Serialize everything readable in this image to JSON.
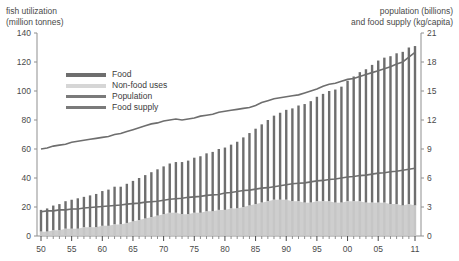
{
  "chart_data": {
    "type": "bar",
    "title": "",
    "subtitle": "",
    "ylabel": "fish utilization\n(million tonnes)",
    "ylabel_right": "population (billions)\nand food supply (kg/capita)",
    "xlabel": "",
    "ylim": [
      0,
      140
    ],
    "ylim_right": [
      0,
      21
    ],
    "yticks": [
      0,
      20,
      40,
      60,
      80,
      100,
      120,
      140
    ],
    "yticks_right": [
      0,
      3,
      6,
      9,
      12,
      15,
      18,
      21
    ],
    "grid": false,
    "legend_position": "upper-left",
    "x": [
      1950,
      1951,
      1952,
      1953,
      1954,
      1955,
      1956,
      1957,
      1958,
      1959,
      1960,
      1961,
      1962,
      1963,
      1964,
      1965,
      1966,
      1967,
      1968,
      1969,
      1970,
      1971,
      1972,
      1973,
      1974,
      1975,
      1976,
      1977,
      1978,
      1979,
      1980,
      1981,
      1982,
      1983,
      1984,
      1985,
      1986,
      1987,
      1988,
      1989,
      1990,
      1991,
      1992,
      1993,
      1994,
      1995,
      1996,
      1997,
      1998,
      1999,
      2000,
      2001,
      2002,
      2003,
      2004,
      2005,
      2006,
      2007,
      2008,
      2009,
      2010,
      2011
    ],
    "xticks": [
      1950,
      1955,
      1960,
      1965,
      1970,
      1975,
      1980,
      1985,
      1990,
      1995,
      2000,
      2005,
      2011
    ],
    "xticklabels": [
      "50",
      "55",
      "60",
      "65",
      "70",
      "75",
      "80",
      "85",
      "90",
      "95",
      "00",
      "05",
      "11"
    ],
    "series": [
      {
        "name": "Food",
        "type": "bar-segment",
        "color": "#6e6e6e",
        "values": [
          15,
          16,
          17,
          18,
          19,
          20,
          21,
          21,
          22,
          23,
          24,
          25,
          26,
          26,
          27,
          28,
          29,
          30,
          31,
          32,
          33,
          34,
          35,
          36,
          37,
          38,
          39,
          40,
          41,
          42,
          43,
          44,
          46,
          48,
          50,
          52,
          54,
          56,
          58,
          60,
          62,
          64,
          66,
          68,
          70,
          72,
          74,
          76,
          78,
          80,
          83,
          86,
          89,
          92,
          95,
          98,
          100,
          102,
          104,
          106,
          108,
          110
        ]
      },
      {
        "name": "Non-food uses",
        "type": "bar-segment",
        "color": "#c6c6c6",
        "values": [
          3,
          3,
          4,
          4,
          5,
          5,
          5,
          6,
          6,
          6,
          7,
          7,
          8,
          8,
          9,
          10,
          11,
          12,
          13,
          14,
          15,
          16,
          16,
          15,
          15,
          16,
          16,
          17,
          17,
          18,
          18,
          19,
          19,
          20,
          21,
          22,
          23,
          24,
          25,
          25,
          25,
          24,
          24,
          23,
          23,
          24,
          24,
          24,
          23,
          23,
          24,
          24,
          24,
          23,
          23,
          23,
          23,
          22,
          22,
          21,
          22,
          21
        ]
      },
      {
        "name": "Population",
        "type": "line",
        "axis": "right",
        "color": "#6e6e6e",
        "values": [
          2.5,
          2.6,
          2.6,
          2.7,
          2.7,
          2.8,
          2.8,
          2.9,
          2.95,
          3.0,
          3.05,
          3.1,
          3.15,
          3.2,
          3.3,
          3.35,
          3.4,
          3.5,
          3.55,
          3.6,
          3.7,
          3.8,
          3.85,
          3.9,
          4.0,
          4.05,
          4.1,
          4.2,
          4.25,
          4.3,
          4.45,
          4.5,
          4.6,
          4.7,
          4.75,
          4.85,
          4.95,
          5.0,
          5.1,
          5.2,
          5.3,
          5.4,
          5.45,
          5.5,
          5.6,
          5.7,
          5.75,
          5.85,
          5.9,
          6.0,
          6.1,
          6.15,
          6.25,
          6.3,
          6.4,
          6.5,
          6.55,
          6.65,
          6.7,
          6.8,
          6.9,
          7.0
        ]
      },
      {
        "name": "Food supply",
        "type": "line",
        "axis": "right",
        "color": "#6e6e6e",
        "values": [
          9.0,
          9.1,
          9.3,
          9.4,
          9.5,
          9.7,
          9.8,
          9.9,
          10.0,
          10.1,
          10.2,
          10.3,
          10.5,
          10.6,
          10.8,
          11.0,
          11.2,
          11.4,
          11.6,
          11.7,
          11.9,
          12.0,
          12.1,
          12.0,
          12.1,
          12.2,
          12.4,
          12.5,
          12.6,
          12.8,
          12.9,
          13.0,
          13.1,
          13.2,
          13.3,
          13.5,
          13.8,
          14.0,
          14.2,
          14.3,
          14.4,
          14.5,
          14.6,
          14.8,
          15.0,
          15.2,
          15.5,
          15.7,
          15.8,
          16.0,
          16.2,
          16.3,
          16.5,
          16.7,
          16.9,
          17.1,
          17.3,
          17.5,
          17.8,
          18.0,
          18.5,
          19.0
        ]
      }
    ],
    "legend": [
      {
        "label": "Food",
        "color": "#6e6e6e",
        "style": "thick-line"
      },
      {
        "label": "Non-food uses",
        "color": "#d6d6d6",
        "style": "thick-line"
      },
      {
        "label": "Population",
        "color": "#7a7a7a",
        "style": "line"
      },
      {
        "label": "Food supply",
        "color": "#7a7a7a",
        "style": "line"
      }
    ]
  },
  "axes": {
    "left_title": "fish utilization\n(million tonnes)",
    "right_title": "population (billions)\nand food supply (kg/capita)"
  }
}
